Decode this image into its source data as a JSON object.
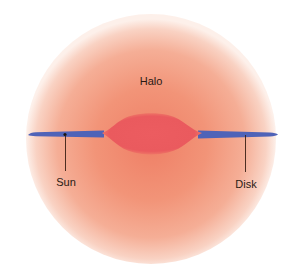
{
  "diagram": {
    "title": "",
    "labels": {
      "halo": "Halo",
      "sun": "Sun",
      "disk": "Disk"
    },
    "colors": {
      "halo_center": "#f08a70",
      "halo_mid": "#f4a48a",
      "halo_edge": "#fbe3d8",
      "bulge": "#ea5a5e",
      "disk": "#4f63b8",
      "leader_line": "#3a1f14",
      "background": "#ffffff"
    },
    "components": [
      {
        "name": "Halo",
        "shape": "sphere"
      },
      {
        "name": "Bulge",
        "shape": "central ellipse"
      },
      {
        "name": "Disk",
        "shape": "thin tapered band"
      },
      {
        "name": "Sun",
        "shape": "point on disk"
      }
    ]
  }
}
